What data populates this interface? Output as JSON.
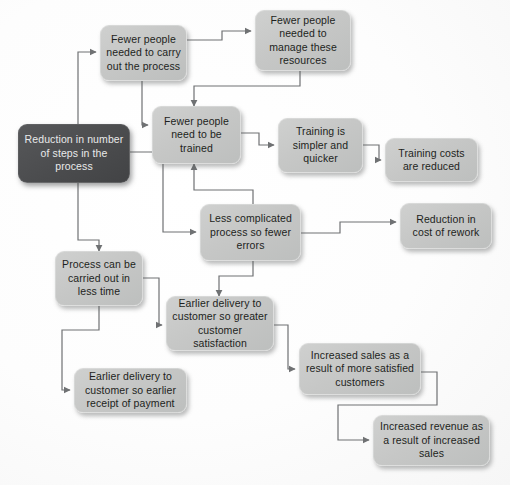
{
  "diagram": {
    "background_color": "#ffffff",
    "node_fill_color": "#c6c7c6",
    "root_fill_color": "#4c4d4f",
    "node_text_color": "#1d1f21",
    "root_text_color": "#e9eaea",
    "edge_color": "#6f7173"
  },
  "nodes": [
    {
      "id": "root",
      "label": "Reduction in number of steps in the process",
      "kind": "root"
    },
    {
      "id": "fewer_carry",
      "label": "Fewer people needed to carry out the process",
      "kind": "step"
    },
    {
      "id": "fewer_manage",
      "label": "Fewer people needed to manage these resources",
      "kind": "step"
    },
    {
      "id": "fewer_train",
      "label": "Fewer people need to be trained",
      "kind": "step"
    },
    {
      "id": "training_simpler",
      "label": "Training is simpler and quicker",
      "kind": "step"
    },
    {
      "id": "training_costs",
      "label": "Training costs are reduced",
      "kind": "step"
    },
    {
      "id": "less_complicated",
      "label": "Less complicated process so fewer errors",
      "kind": "step"
    },
    {
      "id": "rework",
      "label": "Reduction in cost of rework",
      "kind": "step"
    },
    {
      "id": "less_time",
      "label": "Process can be carried out in less time",
      "kind": "step"
    },
    {
      "id": "earlier_satisfaction",
      "label": "Earlier delivery to customer so greater customer satisfaction",
      "kind": "step"
    },
    {
      "id": "earlier_payment",
      "label": "Earlier delivery to customer so earlier receipt of payment",
      "kind": "step"
    },
    {
      "id": "increased_sales",
      "label": "Increased sales as a result of more satisfied customers",
      "kind": "step"
    },
    {
      "id": "increased_revenue",
      "label": "Increased revenue as a result of increased sales",
      "kind": "step"
    }
  ],
  "edges": [
    {
      "from": "root",
      "to": "fewer_carry"
    },
    {
      "from": "root",
      "to": "less_complicated"
    },
    {
      "from": "root",
      "to": "less_time"
    },
    {
      "from": "fewer_carry",
      "to": "fewer_manage"
    },
    {
      "from": "fewer_carry",
      "to": "fewer_train"
    },
    {
      "from": "fewer_manage",
      "to": "fewer_train"
    },
    {
      "from": "fewer_train",
      "to": "training_simpler"
    },
    {
      "from": "training_simpler",
      "to": "training_costs"
    },
    {
      "from": "less_complicated",
      "to": "fewer_train"
    },
    {
      "from": "less_complicated",
      "to": "rework"
    },
    {
      "from": "less_complicated",
      "to": "earlier_satisfaction"
    },
    {
      "from": "less_time",
      "to": "earlier_satisfaction"
    },
    {
      "from": "less_time",
      "to": "earlier_payment"
    },
    {
      "from": "earlier_satisfaction",
      "to": "increased_sales"
    },
    {
      "from": "increased_sales",
      "to": "increased_revenue"
    }
  ]
}
